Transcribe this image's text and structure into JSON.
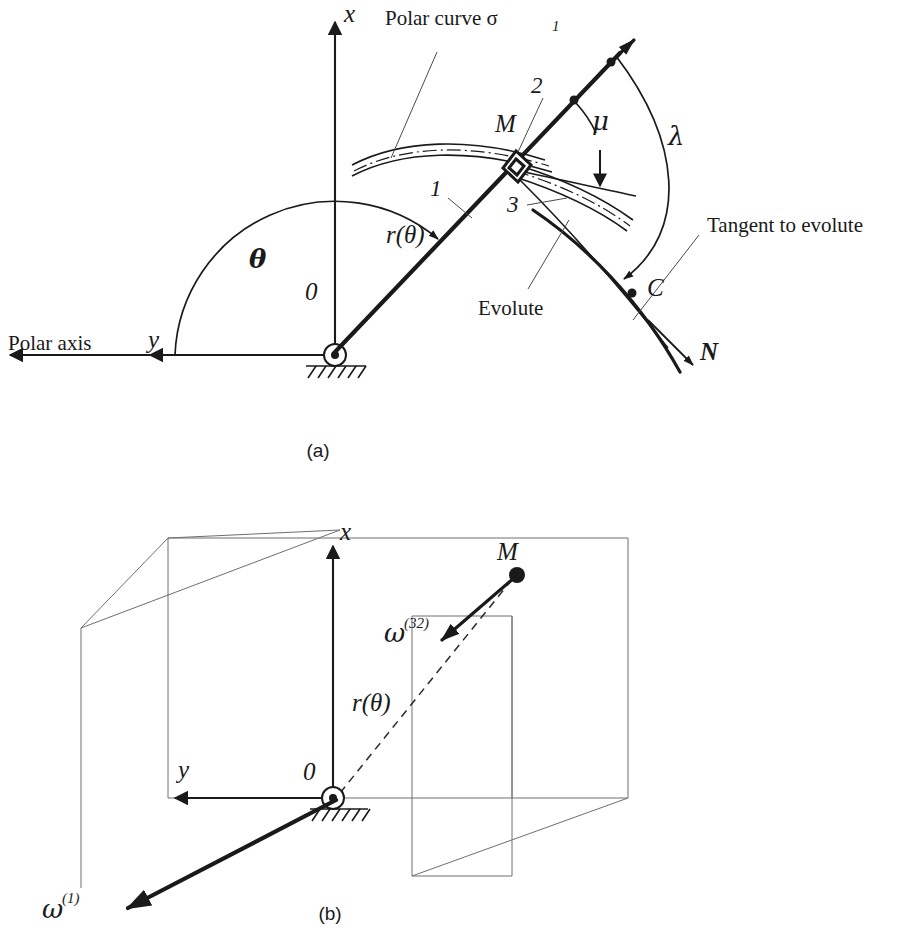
{
  "figure": {
    "title_visible": false,
    "panels": [
      {
        "key": "a",
        "label": "(a)"
      },
      {
        "key": "b",
        "label": "(b)"
      }
    ]
  },
  "panel_a": {
    "axis_x_label": "x",
    "axis_y_label": "y",
    "origin_label": "0",
    "polar_axis_label": "Polar axis",
    "polar_curve_label": "Polar curve σ",
    "polar_curve_sub": "1",
    "theta_label": "θ",
    "radius_label": "r(θ)",
    "point_m_label": "M",
    "point_c_label": "C",
    "link_1_label": "1",
    "link_2_label": "2",
    "link_3_label": "3",
    "mu_label": "μ",
    "lambda_label": "λ",
    "evolute_label": "Evolute",
    "tangent_label": "Tangent to evolute",
    "normal_label": "N"
  },
  "panel_b": {
    "axis_x_label": "x",
    "axis_y_label": "y",
    "origin_label": "0",
    "radius_label": "r(θ)",
    "point_m_label": "M",
    "omega_32_base": "ω",
    "omega_32_sup": "(32)",
    "omega_1_base": "ω",
    "omega_1_sup": "(1)"
  },
  "colors": {
    "ink": "#1a1a1a",
    "leader": "#4a4a4a",
    "plane": "#6e6e6e",
    "background": "#ffffff"
  }
}
